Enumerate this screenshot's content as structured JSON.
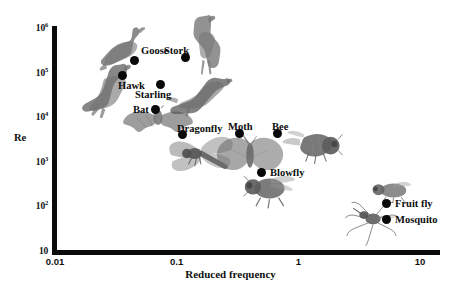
{
  "chart_data": {
    "type": "scatter",
    "title": "",
    "xlabel": "Reduced frequency",
    "ylabel": "Re",
    "xscale": "log",
    "yscale": "log",
    "xlim": [
      0.01,
      10
    ],
    "ylim": [
      10,
      1000000
    ],
    "grid": false,
    "legend": "none",
    "xticklabels": [
      "0.01",
      "0.1",
      "1",
      "10"
    ],
    "xtickvalues": [
      0.01,
      0.1,
      1,
      10
    ],
    "yticklabels": [
      "10",
      "10^2",
      "10^3",
      "10^4",
      "10^5",
      "10^6"
    ],
    "ytickvalues": [
      10,
      100,
      1000,
      10000,
      100000,
      1000000
    ],
    "points": [
      {
        "label": "Goose",
        "x": 0.042,
        "y": 200000,
        "px": 134,
        "py": 60,
        "lx": 141,
        "ly": 50
      },
      {
        "label": "Stork",
        "x": 0.105,
        "y": 240000,
        "px": 185,
        "py": 57,
        "lx": 164,
        "ly": 50
      },
      {
        "label": "Hawk",
        "x": 0.036,
        "y": 95000,
        "px": 122,
        "py": 75,
        "lx": 118,
        "ly": 85
      },
      {
        "label": "Starling",
        "x": 0.062,
        "y": 50000,
        "px": 160,
        "py": 84,
        "lx": 135,
        "ly": 94
      },
      {
        "label": "Bat",
        "x": 0.058,
        "y": 13000,
        "px": 155,
        "py": 109,
        "lx": 133,
        "ly": 109
      },
      {
        "label": "Dragonfly",
        "x": 0.105,
        "y": 4500,
        "px": 182,
        "py": 134,
        "lx": 177,
        "ly": 128
      },
      {
        "label": "Moth",
        "x": 0.32,
        "y": 4800,
        "px": 239,
        "py": 133,
        "lx": 228,
        "ly": 126
      },
      {
        "label": "Bee",
        "x": 0.66,
        "y": 4700,
        "px": 277,
        "py": 133,
        "lx": 272,
        "ly": 126
      },
      {
        "label": "Blowfly",
        "x": 0.44,
        "y": 620,
        "px": 261,
        "py": 172,
        "lx": 270,
        "ly": 172
      },
      {
        "label": "Fruit fly",
        "x": 5.0,
        "y": 110,
        "px": 386,
        "py": 203,
        "lx": 395,
        "ly": 203
      },
      {
        "label": "Mosquito",
        "x": 5.0,
        "y": 45,
        "px": 386,
        "py": 219,
        "lx": 395,
        "ly": 219
      }
    ],
    "organism_images": [
      {
        "name": "goose",
        "x": 95,
        "y": 25,
        "w": 75,
        "h": 48
      },
      {
        "name": "stork",
        "x": 178,
        "y": 14,
        "w": 52,
        "h": 62
      },
      {
        "name": "hawk",
        "x": 80,
        "y": 60,
        "w": 70,
        "h": 58
      },
      {
        "name": "starling",
        "x": 165,
        "y": 73,
        "w": 68,
        "h": 45
      },
      {
        "name": "bat",
        "x": 122,
        "y": 105,
        "w": 72,
        "h": 38
      },
      {
        "name": "dragonfly",
        "x": 160,
        "y": 130,
        "w": 82,
        "h": 47
      },
      {
        "name": "moth",
        "x": 215,
        "y": 135,
        "w": 70,
        "h": 45
      },
      {
        "name": "bee",
        "x": 282,
        "y": 128,
        "w": 65,
        "h": 40
      },
      {
        "name": "blowfly",
        "x": 238,
        "y": 170,
        "w": 60,
        "h": 40
      },
      {
        "name": "fruit-fly",
        "x": 368,
        "y": 178,
        "w": 45,
        "h": 25
      },
      {
        "name": "mosquito",
        "x": 344,
        "y": 198,
        "w": 55,
        "h": 48
      }
    ]
  },
  "colors": {
    "axis": "#0b0b0b",
    "marker": "#090909",
    "text": "#101010",
    "background": "#ffffff"
  }
}
